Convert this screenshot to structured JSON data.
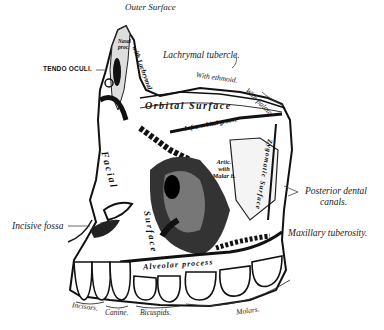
{
  "figure": {
    "subject": "Maxilla",
    "view": "Outer Surface"
  },
  "labels": {
    "outer_surface": "Outer Surface",
    "lachrymal_tubercle": "Lachrymal tubercle.",
    "tendo_oculi": "TENDO OCULI.",
    "with_ethmoid": "With ethmoid.",
    "with_palate": "With palate.",
    "orbital_surface": "Orbital Surface",
    "infra_orbital_groove": "Infra-orbital groove",
    "artic_with_malar": "Artic. with Malar b.",
    "zygomatic_surface": "Zygomatic Surface",
    "posterior_dental_canals_1": "Posterior dental",
    "posterior_dental_canals_2": "canals.",
    "maxillary_tuberosity": "Maxillary tuberosity.",
    "incisive_fossa": "Incisive fossa",
    "facial_surface_1": "Facial",
    "facial_surface_2": "Surface",
    "alveolar_process": "Alveolar process",
    "nasal_process": "Nasal proc.",
    "with_lachrymal": "with Lachrymal.",
    "incisors": "Incisors.",
    "canine": "Canine.",
    "bicuspids": "Bicuspids.",
    "molars": "Molars."
  }
}
